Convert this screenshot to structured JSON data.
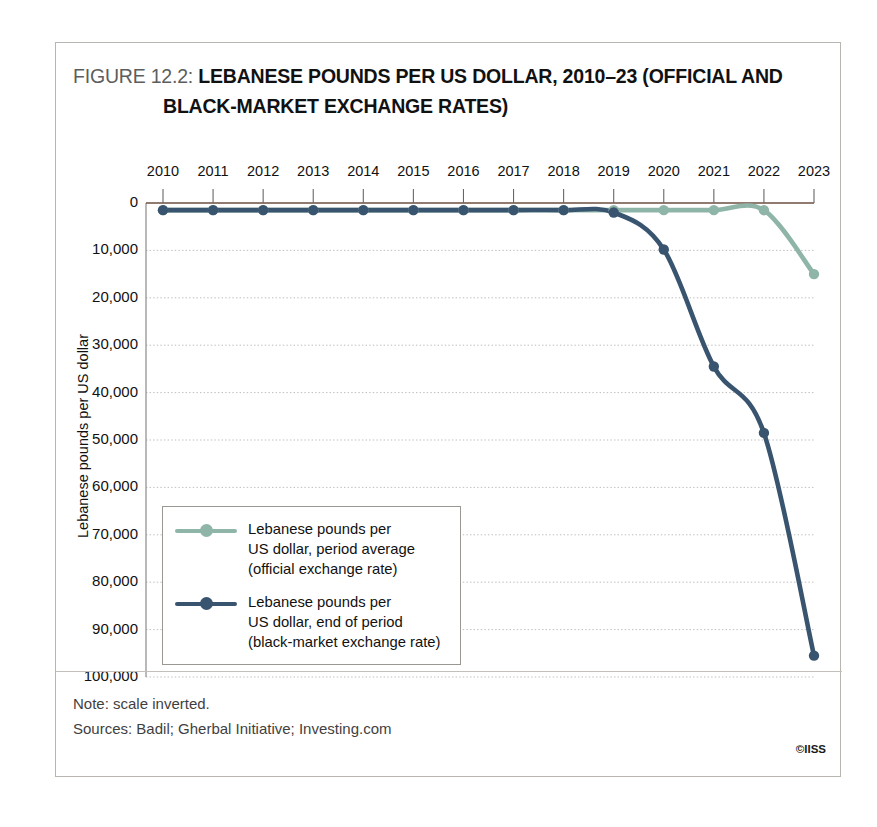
{
  "figure": {
    "label": "FIGURE 12.2:",
    "title_line1": "LEBANESE POUNDS PER US DOLLAR, 2010–23 (OFFICIAL AND",
    "title_line2": "BLACK-MARKET EXCHANGE RATES)"
  },
  "footer": {
    "note": "Note: scale inverted.",
    "sources": "Sources: Badil; Gherbal Initiative; Investing.com",
    "copyright": "©IISS"
  },
  "legend": {
    "position": "inside-left",
    "entries": [
      {
        "name": "official-rate",
        "label": "Lebanese pounds per\nUS dollar, period average\n(official exchange rate)",
        "color": "#8fb5a8"
      },
      {
        "name": "black-market-rate",
        "label": "Lebanese pounds per\nUS dollar, end of period\n(black-market exchange rate)",
        "color": "#39546f"
      }
    ]
  },
  "chart_data": {
    "type": "line",
    "title": "LEBANESE POUNDS PER US DOLLAR, 2010–23 (OFFICIAL AND BLACK-MARKET EXCHANGE RATES)",
    "xlabel": "",
    "ylabel": "Lebanese pounds per US dollar",
    "x": [
      2010,
      2011,
      2012,
      2013,
      2014,
      2015,
      2016,
      2017,
      2018,
      2019,
      2020,
      2021,
      2022,
      2023
    ],
    "xtick_labels": [
      "2010",
      "2011",
      "2012",
      "2013",
      "2014",
      "2015",
      "2016",
      "2017",
      "2018",
      "2019",
      "2020",
      "2021",
      "2022",
      "2023"
    ],
    "ytick_labels": [
      "0",
      "10,000",
      "20,000",
      "30,000",
      "40,000",
      "50,000",
      "60,000",
      "70,000",
      "80,000",
      "90,000",
      "100,000"
    ],
    "yticks": [
      0,
      10000,
      20000,
      30000,
      40000,
      50000,
      60000,
      70000,
      80000,
      90000,
      100000
    ],
    "ylim": [
      0,
      100000
    ],
    "y_axis_inverted": true,
    "grid": "horizontal-dotted",
    "legend_position": "inside-left",
    "series": [
      {
        "name": "Lebanese pounds per US dollar, period average (official exchange rate)",
        "short_name": "official",
        "color": "#8fb5a8",
        "values": [
          1507,
          1507,
          1507,
          1507,
          1507,
          1507,
          1507,
          1507,
          1507,
          1510,
          1510,
          1510,
          1515,
          15000
        ]
      },
      {
        "name": "Lebanese pounds per US dollar, end of period (black-market exchange rate)",
        "short_name": "black_market",
        "color": "#39546f",
        "values": [
          1507,
          1507,
          1507,
          1507,
          1507,
          1507,
          1507,
          1507,
          1510,
          2000,
          9800,
          34500,
          48500,
          95500
        ]
      }
    ]
  }
}
